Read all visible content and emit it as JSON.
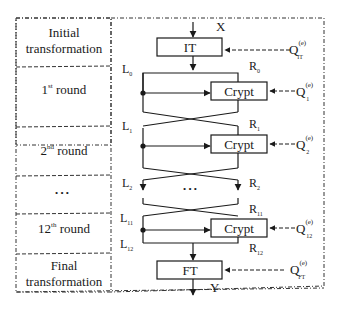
{
  "stages": [
    {
      "label_line1": "Initial",
      "label_line2": "transformation"
    },
    {
      "label_main": "1",
      "label_sup": "st",
      "label_rest": " round"
    },
    {
      "label_main": "2",
      "label_sup": "nd",
      "label_rest": " round"
    },
    {
      "label_dots": "•   •   •"
    },
    {
      "label_main": "12",
      "label_sup": "th",
      "label_rest": " round"
    },
    {
      "label_line1": "Final",
      "label_line2": "transformation"
    }
  ],
  "blocks": {
    "it": "IT",
    "crypt1": "Crypt",
    "crypt2": "Crypt",
    "crypt12": "Crypt",
    "ft": "FT"
  },
  "io": {
    "input": "X",
    "output": "Y"
  },
  "left_labels": [
    {
      "base": "L",
      "sub": "0"
    },
    {
      "base": "L",
      "sub": "1"
    },
    {
      "base": "L",
      "sub": "2"
    },
    {
      "base": "L",
      "sub": "11"
    },
    {
      "base": "L",
      "sub": "12"
    }
  ],
  "right_labels": [
    {
      "base": "R",
      "sub": "0"
    },
    {
      "base": "R",
      "sub": "1"
    },
    {
      "base": "R",
      "sub": "2"
    },
    {
      "base": "R",
      "sub": "11"
    },
    {
      "base": "R",
      "sub": "12"
    }
  ],
  "keys": [
    {
      "base": "Q",
      "sup": "(e)",
      "sub": "IT"
    },
    {
      "base": "Q",
      "sup": "(e)",
      "sub": "1"
    },
    {
      "base": "Q",
      "sup": "(e)",
      "sub": "2"
    },
    {
      "base": "Q",
      "sup": "(e)",
      "sub": "12"
    },
    {
      "base": "Q",
      "sup": "(e)",
      "sub": "FT"
    }
  ],
  "middle_dots": "•   •   •"
}
